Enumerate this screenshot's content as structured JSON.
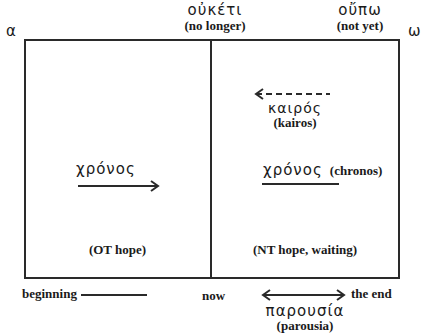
{
  "endpoints": {
    "alpha": "α",
    "omega": "ω"
  },
  "top_labels": {
    "ouketi": {
      "greek": "οὐκέτι",
      "gloss": "(no longer)"
    },
    "oupo": {
      "greek": "οὔπω",
      "gloss": "(not yet)"
    }
  },
  "left_panel": {
    "chronos": "χρόνος",
    "caption": "(OT hope)"
  },
  "right_panel": {
    "kairos": {
      "greek": "καιρός",
      "gloss": "(kairos)"
    },
    "chronos": {
      "greek": "χρόνος",
      "gloss": "(chronos)"
    },
    "caption": "(NT hope, waiting)"
  },
  "timeline": {
    "beginning": "beginning",
    "now": "now",
    "end": "the end",
    "parousia": {
      "greek": "παρουσία",
      "gloss": "(parousia)"
    }
  },
  "colors": {
    "line": "#2a2a2a",
    "text": "#1a1a1a",
    "background": "#ffffff"
  }
}
